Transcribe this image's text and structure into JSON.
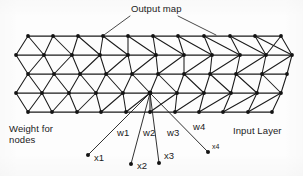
{
  "figure": {
    "title_label": "Output map",
    "left_label_line1": "Weight for",
    "left_label_line2": "nodes",
    "right_label": "Input Layer",
    "ink_color": "#1b1b1b",
    "background_color": "#fdfdfd"
  },
  "weights": [
    {
      "name": "w1",
      "label": "w1"
    },
    {
      "name": "w2",
      "label": "w2"
    },
    {
      "name": "w3",
      "label": "w3"
    },
    {
      "name": "w4",
      "label": "w4"
    }
  ],
  "inputs": [
    {
      "name": "x1",
      "label": "x1"
    },
    {
      "name": "x2",
      "label": "x2"
    },
    {
      "name": "x3",
      "label": "x3"
    },
    {
      "name": "x4",
      "label": "x4"
    }
  ],
  "diagram_structure": {
    "type": "triangular-lattice",
    "rows": 5,
    "nodes_per_row": [
      11,
      11,
      11,
      11,
      11
    ],
    "hub_node": {
      "row": 4,
      "label": "winning-node"
    }
  }
}
